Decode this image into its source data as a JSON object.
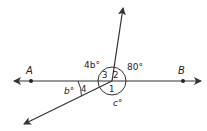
{
  "diagram": {
    "points": {
      "A": {
        "label": "A",
        "x": 31,
        "y": 81
      },
      "B": {
        "label": "B",
        "x": 183,
        "y": 81
      },
      "O": {
        "x": 112,
        "y": 81
      }
    },
    "angle_labels": {
      "angle3_measure": "4b°",
      "angle2_measure": "80°",
      "angle4_measure": "b°",
      "angle1_measure": "c°"
    },
    "angle_numbers": {
      "n1": "1",
      "n2": "2",
      "n3": "3",
      "n4": "4"
    },
    "stroke_color": "#333333"
  }
}
